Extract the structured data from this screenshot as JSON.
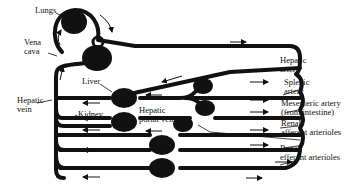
{
  "diagram": {
    "colors": {
      "vessel": "#111111",
      "background": "#ffffff",
      "text": "#111111"
    },
    "labels": {
      "lungs": "Lungs",
      "vena_cava_1": "Vena",
      "vena_cava_2": "cava",
      "liver": "Liver",
      "hepatic_vein_1": "Hepatic",
      "hepatic_vein_2": "vein",
      "kidney": "Kidney",
      "hepatic_portal_1": "Hepatic",
      "hepatic_portal_2": "portal vein",
      "hepatic_artery_1": "Hepatic",
      "hepatic_artery_2": "artery",
      "splenic_1": "Splenic",
      "splenic_2": "artery",
      "mesenteric_1": "Mesenteric artery",
      "mesenteric_2": "(from intestine)",
      "renal_aff_1": "Renal",
      "renal_aff_2": "afferent arterioles",
      "renal_eff_1": "Renal",
      "renal_eff_2": "efferent arterioles"
    },
    "organs": [
      "Lungs",
      "Heart",
      "Liver",
      "Spleen",
      "Intestine",
      "Kidney",
      "Capillary bed"
    ],
    "flow_arrows": {
      "left_side": "leftward",
      "right_side": "rightward"
    }
  }
}
